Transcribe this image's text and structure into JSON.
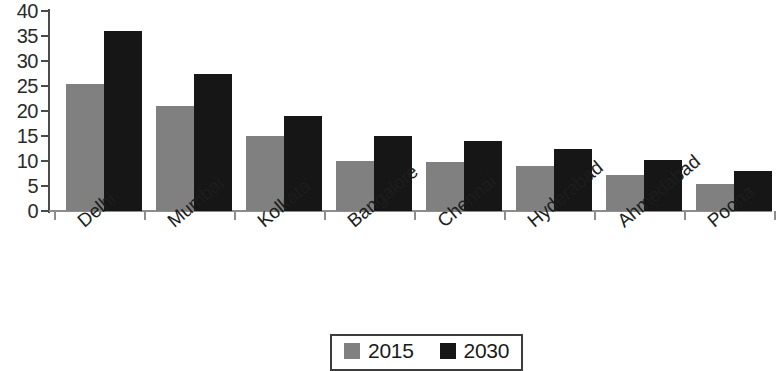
{
  "chart_data": {
    "type": "bar",
    "title": "",
    "xlabel": "",
    "ylabel": "",
    "ylim": [
      0,
      40
    ],
    "yticks": [
      0,
      5,
      10,
      15,
      20,
      25,
      30,
      35,
      40
    ],
    "grid": false,
    "legend_position": "bottom-center",
    "categories": [
      "Delhi",
      "Mumbai",
      "Kolkata",
      "Bangalore",
      "Chennai",
      "Hyderabad",
      "Ahmedabad",
      "Poona"
    ],
    "series": [
      {
        "name": "2015",
        "color": "#808080",
        "values": [
          25.5,
          21,
          15,
          10,
          9.8,
          9,
          7.2,
          5.5
        ]
      },
      {
        "name": "2030",
        "color": "#161616",
        "values": [
          36,
          27.5,
          19,
          15,
          14,
          12.5,
          10.3,
          8
        ]
      }
    ]
  },
  "legend": {
    "items": [
      {
        "label": "2015",
        "swatch": "gray-swatch-icon"
      },
      {
        "label": "2030",
        "swatch": "black-swatch-icon"
      }
    ]
  }
}
